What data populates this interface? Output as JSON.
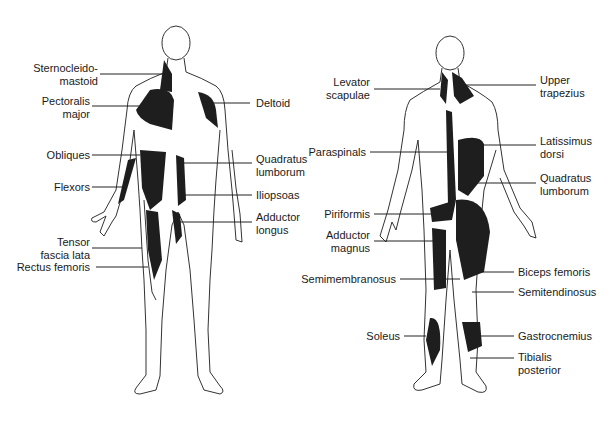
{
  "figure": {
    "type": "anatomical muscle diagram",
    "views": [
      "anterior",
      "posterior"
    ],
    "muscle_fill": "#1e1e1e",
    "outline_color": "#333333",
    "anterior_labels": {
      "left": [
        {
          "lines": [
            "Sternocleido-",
            "mastoid"
          ]
        },
        {
          "lines": [
            "Pectoralis",
            "major"
          ]
        },
        {
          "lines": [
            "Obliques"
          ]
        },
        {
          "lines": [
            "Flexors"
          ]
        },
        {
          "lines": [
            "Tensor",
            "fascia lata"
          ]
        },
        {
          "lines": [
            "Rectus femoris"
          ]
        }
      ],
      "right": [
        {
          "lines": [
            "Deltoid"
          ]
        },
        {
          "lines": [
            "Quadratus",
            "lumborum"
          ]
        },
        {
          "lines": [
            "Iliopsoas"
          ]
        },
        {
          "lines": [
            "Adductor",
            "longus"
          ]
        }
      ]
    },
    "posterior_labels": {
      "left": [
        {
          "lines": [
            "Levator",
            "scapulae"
          ]
        },
        {
          "lines": [
            "Paraspinals"
          ]
        },
        {
          "lines": [
            "Piriformis"
          ]
        },
        {
          "lines": [
            "Adductor",
            "magnus"
          ]
        },
        {
          "lines": [
            "Semimembranosus"
          ]
        },
        {
          "lines": [
            "Soleus"
          ]
        }
      ],
      "right": [
        {
          "lines": [
            "Upper",
            "trapezius"
          ]
        },
        {
          "lines": [
            "Latissimus",
            "dorsi"
          ]
        },
        {
          "lines": [
            "Quadratus",
            "lumborum"
          ]
        },
        {
          "lines": [
            "Biceps femoris"
          ]
        },
        {
          "lines": [
            "Semitendinosus"
          ]
        },
        {
          "lines": [
            "Gastrocnemius"
          ]
        },
        {
          "lines": [
            "Tibialis",
            "posterior"
          ]
        }
      ]
    }
  }
}
